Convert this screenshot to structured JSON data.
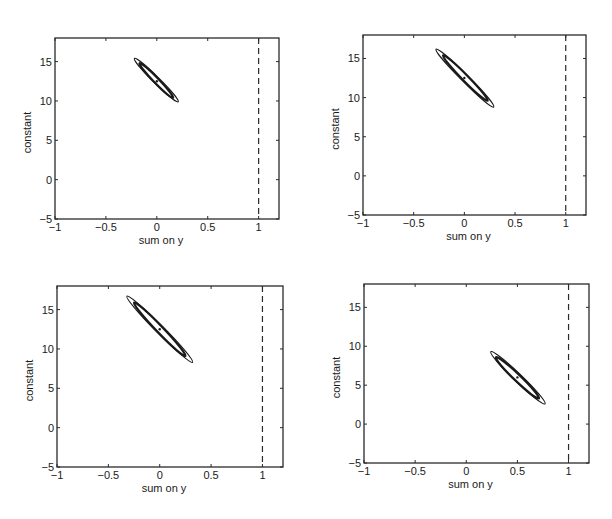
{
  "figure": {
    "panel_count": 4
  },
  "chart_data": [
    {
      "type": "scatter",
      "panel": "top-left",
      "title": "",
      "xlabel": "sum on y",
      "ylabel": "constant",
      "xlim": [
        -1,
        1.2
      ],
      "ylim": [
        -5,
        18
      ],
      "xticks": [
        -1,
        -0.5,
        0,
        0.5,
        1
      ],
      "xtick_labels": [
        "−1",
        "−0.5",
        "0",
        "0.5",
        "1"
      ],
      "yticks": [
        -5,
        0,
        5,
        10,
        15
      ],
      "ytick_labels": [
        "−5",
        "0",
        "5",
        "10",
        "15"
      ],
      "grid": false,
      "reference_line": {
        "orientation": "vertical",
        "x": 1,
        "style": "dashed"
      },
      "center": {
        "x": 0.0,
        "y": 12.5
      },
      "ellipses": [
        {
          "name": "outer",
          "endpoints": [
            [
              -0.22,
              15.4
            ],
            [
              0.21,
              9.9
            ]
          ],
          "minor_half_px": 3.2,
          "stroke_width": 1.1
        },
        {
          "name": "inner",
          "endpoints": [
            [
              -0.17,
              14.8
            ],
            [
              0.16,
              10.4
            ]
          ],
          "minor_half_px": 2.6,
          "stroke_width": 2.2
        }
      ]
    },
    {
      "type": "scatter",
      "panel": "top-right",
      "title": "",
      "xlabel": "sum on y",
      "ylabel": "constant",
      "xlim": [
        -1,
        1.2
      ],
      "ylim": [
        -5,
        18
      ],
      "xticks": [
        -1,
        -0.5,
        0,
        0.5,
        1
      ],
      "xtick_labels": [
        "−1",
        "−0.5",
        "0",
        "0.5",
        "1"
      ],
      "yticks": [
        -5,
        0,
        5,
        10,
        15
      ],
      "ytick_labels": [
        "−5",
        "0",
        "5",
        "10",
        "15"
      ],
      "grid": false,
      "reference_line": {
        "orientation": "vertical",
        "x": 1,
        "style": "dashed"
      },
      "center": {
        "x": 0.0,
        "y": 12.5
      },
      "ellipses": [
        {
          "name": "outer",
          "endpoints": [
            [
              -0.28,
              16.2
            ],
            [
              0.29,
              8.8
            ]
          ],
          "minor_half_px": 3.6,
          "stroke_width": 1.1
        },
        {
          "name": "inner",
          "endpoints": [
            [
              -0.21,
              15.4
            ],
            [
              0.23,
              9.6
            ]
          ],
          "minor_half_px": 3.0,
          "stroke_width": 2.2
        }
      ]
    },
    {
      "type": "scatter",
      "panel": "bottom-left",
      "title": "",
      "xlabel": "sum on y",
      "ylabel": "constant",
      "xlim": [
        -1,
        1.2
      ],
      "ylim": [
        -5,
        18
      ],
      "xticks": [
        -1,
        -0.5,
        0,
        0.5,
        1
      ],
      "xtick_labels": [
        "−1",
        "−0.5",
        "0",
        "0.5",
        "1"
      ],
      "yticks": [
        -5,
        0,
        5,
        10,
        15
      ],
      "ytick_labels": [
        "−5",
        "0",
        "5",
        "10",
        "15"
      ],
      "grid": false,
      "reference_line": {
        "orientation": "vertical",
        "x": 1,
        "style": "dashed"
      },
      "center": {
        "x": 0.0,
        "y": 12.5
      },
      "ellipses": [
        {
          "name": "outer",
          "endpoints": [
            [
              -0.32,
              16.7
            ],
            [
              0.32,
              8.3
            ]
          ],
          "minor_half_px": 4.0,
          "stroke_width": 1.1
        },
        {
          "name": "inner",
          "endpoints": [
            [
              -0.25,
              15.9
            ],
            [
              0.25,
              9.1
            ]
          ],
          "minor_half_px": 3.3,
          "stroke_width": 2.2
        }
      ]
    },
    {
      "type": "scatter",
      "panel": "bottom-right",
      "title": "",
      "xlabel": "sum on y",
      "ylabel": "constant",
      "xlim": [
        -1,
        1.2
      ],
      "ylim": [
        -5,
        18
      ],
      "xticks": [
        -1,
        -0.5,
        0,
        0.5,
        1
      ],
      "xtick_labels": [
        "−1",
        "−0.5",
        "0",
        "0.5",
        "1"
      ],
      "yticks": [
        -5,
        0,
        5,
        10,
        15
      ],
      "ytick_labels": [
        "−5",
        "0",
        "5",
        "10",
        "15"
      ],
      "grid": false,
      "reference_line": {
        "orientation": "vertical",
        "x": 1,
        "style": "dashed"
      },
      "center": {
        "x": 0.5,
        "y": 6.0
      },
      "ellipses": [
        {
          "name": "outer",
          "endpoints": [
            [
              0.24,
              9.3
            ],
            [
              0.77,
              2.6
            ]
          ],
          "minor_half_px": 4.0,
          "stroke_width": 1.1
        },
        {
          "name": "inner",
          "endpoints": [
            [
              0.29,
              8.6
            ],
            [
              0.71,
              3.3
            ]
          ],
          "minor_half_px": 3.3,
          "stroke_width": 2.2
        }
      ]
    }
  ],
  "layout": {
    "panels": [
      {
        "left": 55,
        "top": 38,
        "right": 279,
        "bottom": 219
      },
      {
        "left": 363,
        "top": 35,
        "right": 586,
        "bottom": 215
      },
      {
        "left": 57,
        "top": 286,
        "right": 283,
        "bottom": 467
      },
      {
        "left": 364,
        "top": 284,
        "right": 589,
        "bottom": 463
      }
    ],
    "colors": {
      "axis": "#2a2a2a",
      "ellipse": "#1a1a1a",
      "dashed_line": "#2a2a2a",
      "background": "#ffffff"
    }
  }
}
